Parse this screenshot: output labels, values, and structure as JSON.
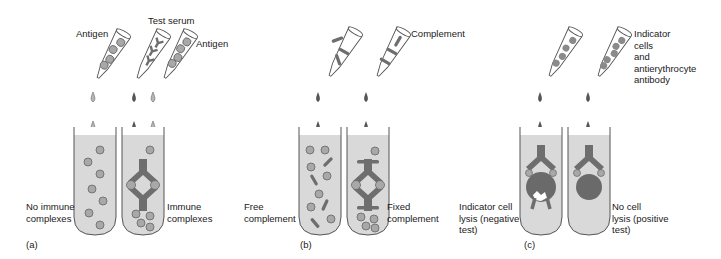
{
  "figure": {
    "panels": [
      {
        "id": "a",
        "panel_label": "(a)",
        "reagents": {
          "antigen_left": "Antigen",
          "test_serum": "Test serum",
          "antigen_right": "Antigen"
        },
        "results": {
          "left": "No immune\ncomplexes",
          "right": "Immune\ncomplexes"
        }
      },
      {
        "id": "b",
        "panel_label": "(b)",
        "reagents": {
          "complement": "Complement"
        },
        "results": {
          "left": "Free\ncomplement",
          "right": "Fixed\ncomplement"
        }
      },
      {
        "id": "c",
        "panel_label": "(c)",
        "reagents": {
          "indicator": "Indicator\ncells\nand\nantierythrocyte\nantibody"
        },
        "results": {
          "left": "Indicator cell\nlysis (negative\ntest)",
          "right": "No cell\nlysis (positive\ntest)"
        }
      }
    ],
    "colors": {
      "tube_fill": "#d9d9d9",
      "outline": "#555555",
      "antibody": "#6e6e6e",
      "antigen_bead": "#a8a8a8",
      "cell": "#6a6a6a"
    }
  }
}
